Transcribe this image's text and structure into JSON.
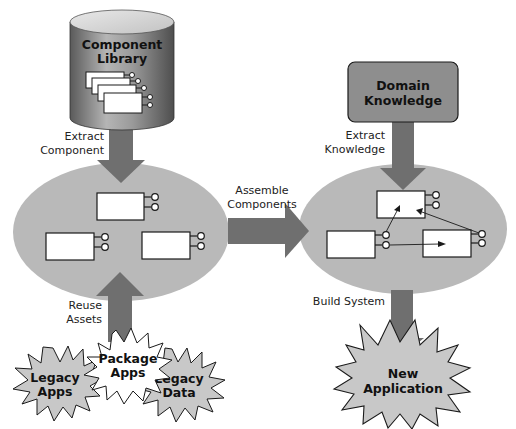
{
  "diagram": {
    "colors": {
      "ellipse": "#b9b9b9",
      "arrow": "#6f6f6f",
      "box_fill": "#ffffff",
      "stroke": "#1a1a1a",
      "cylinder_dark": "#6e6e6e",
      "cylinder_light": "#c8c8c8",
      "domain_box": "#8e8e8e",
      "starburst": "#c8c8c8"
    },
    "component_library": {
      "line1": "Component",
      "line2": "Library"
    },
    "domain_knowledge": {
      "line1": "Domain",
      "line2": "Knowledge"
    },
    "labels": {
      "extract_component": [
        "Extract",
        "Component"
      ],
      "extract_knowledge": [
        "Extract",
        "Knowledge"
      ],
      "assemble_components": [
        "Assemble",
        "Components"
      ],
      "reuse_assets": [
        "Reuse",
        "Assets"
      ],
      "build_system": "Build System"
    },
    "sources": [
      {
        "line1": "Legacy",
        "line2": "Apps"
      },
      {
        "line1": "Package",
        "line2": "Apps"
      },
      {
        "line1": "Legacy",
        "line2": "Data"
      }
    ],
    "new_application": {
      "line1": "New",
      "line2": "Application"
    }
  }
}
